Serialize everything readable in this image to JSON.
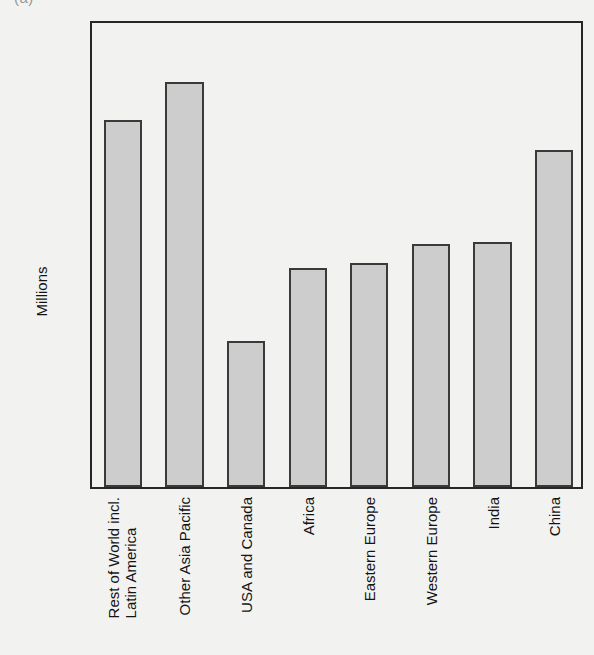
{
  "figure": {
    "label": "(a)"
  },
  "chart_data": {
    "type": "bar",
    "title": "",
    "xlabel": "",
    "ylabel": "Millions",
    "ylim": [
      0,
      1000
    ],
    "ytick_labels": [
      "0",
      "200",
      "400",
      "600",
      "800",
      "1000"
    ],
    "ytick_values": [
      0,
      200,
      400,
      600,
      800,
      1000
    ],
    "grid": false,
    "legend": false,
    "bar_fill_color": "#cdcdcd",
    "bar_edge_color": "#3a3a3a",
    "background_color": "#f2f2f0",
    "categories": [
      "Rest of World incl. Latin America",
      "Other Asia Pacific",
      "USA and Canada",
      "Africa",
      "Eastern Europe",
      "Western Europe",
      "India",
      "China"
    ],
    "category_lines": [
      [
        "Rest of World incl.",
        "Latin America"
      ],
      [
        "Other Asia Pacific"
      ],
      [
        "USA and Canada"
      ],
      [
        "Africa"
      ],
      [
        "Eastern Europe"
      ],
      [
        "Western Europe"
      ],
      [
        "India"
      ],
      [
        "China"
      ]
    ],
    "values": [
      784,
      865,
      312,
      468,
      479,
      519,
      523,
      720
    ]
  }
}
